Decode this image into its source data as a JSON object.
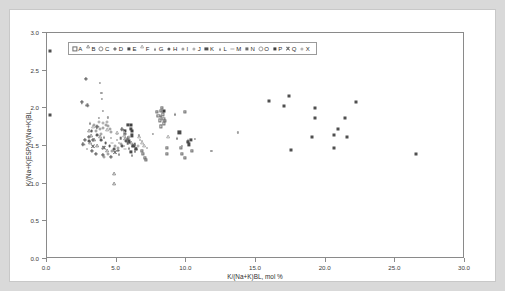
{
  "page": {
    "background_color": "#d9d9d9",
    "paper_color": "#ffffff"
  },
  "chart_data": {
    "type": "scatter",
    "title": "",
    "xlabel": "K/(Na+K)BL, mol %",
    "ylabel": "K/(Na+K)ESP/K/(Na+K)BL",
    "xlim": [
      0.0,
      30.0
    ],
    "ylim": [
      0.0,
      3.0
    ],
    "xticks": [
      "0.0",
      "5.0",
      "10.0",
      "15.0",
      "20.0",
      "25.0",
      "30.0"
    ],
    "xtick_values": [
      0,
      5,
      10,
      15,
      20,
      25,
      30
    ],
    "yticks": [
      "0.0",
      "0.5",
      "1.0",
      "1.5",
      "2.0",
      "2.5",
      "3.0"
    ],
    "ytick_values": [
      0,
      0.5,
      1.0,
      1.5,
      2.0,
      2.5,
      3.0
    ],
    "grid": false,
    "legend_position": "top-left-inside",
    "legend_border": true,
    "series": [
      {
        "name": "A",
        "marker": "open-square",
        "color": "#6d6d6d",
        "size": 3.2,
        "points": [
          [
            7.9,
            1.95
          ],
          [
            8.0,
            1.9
          ],
          [
            8.1,
            1.84
          ],
          [
            8.2,
            1.97
          ],
          [
            8.3,
            1.92
          ],
          [
            8.35,
            1.86
          ],
          [
            8.4,
            1.8
          ],
          [
            8.15,
            1.76
          ],
          [
            8.45,
            1.83
          ],
          [
            8.25,
            2.01
          ],
          [
            9.9,
            1.95
          ],
          [
            8.6,
            1.48
          ],
          [
            8.6,
            1.39
          ],
          [
            9.6,
            1.47
          ],
          [
            9.7,
            1.39
          ],
          [
            9.9,
            1.34
          ],
          [
            10.4,
            1.43
          ],
          [
            6.9,
            1.4
          ],
          [
            7.0,
            1.34
          ],
          [
            7.1,
            1.32
          ],
          [
            6.8,
            1.44
          ]
        ]
      },
      {
        "name": "B",
        "marker": "open-triangle",
        "color": "#7a7a7a",
        "size": 3.2,
        "points": [
          [
            3.0,
            1.68
          ],
          [
            3.2,
            1.62
          ],
          [
            3.4,
            1.56
          ],
          [
            3.1,
            1.52
          ],
          [
            3.6,
            1.48
          ],
          [
            4.0,
            1.46
          ],
          [
            4.3,
            1.42
          ],
          [
            3.8,
            1.6
          ],
          [
            4.8,
            1.12
          ],
          [
            4.8,
            0.98
          ],
          [
            5.6,
            1.58
          ],
          [
            6.0,
            1.52
          ],
          [
            6.2,
            1.48
          ],
          [
            6.4,
            1.44
          ]
        ]
      },
      {
        "name": "C",
        "marker": "open-circle",
        "color": "#8a8a8a",
        "size": 3.0,
        "points": [
          [
            3.4,
            1.78
          ],
          [
            3.6,
            1.76
          ],
          [
            3.8,
            1.72
          ],
          [
            4.0,
            1.74
          ],
          [
            4.2,
            1.78
          ],
          [
            4.4,
            1.76
          ],
          [
            4.5,
            1.72
          ],
          [
            3.9,
            1.66
          ],
          [
            3.5,
            1.7
          ],
          [
            4.6,
            1.68
          ],
          [
            4.9,
            1.5
          ],
          [
            5.1,
            1.48
          ],
          [
            5.3,
            1.52
          ],
          [
            4.7,
            1.44
          ],
          [
            4.4,
            1.4
          ],
          [
            4.1,
            1.36
          ]
        ]
      },
      {
        "name": "D",
        "marker": "plus",
        "color": "#6f6f6f",
        "size": 3.4,
        "points": [
          [
            2.8,
            2.39
          ],
          [
            2.5,
            2.08
          ],
          [
            2.9,
            2.04
          ],
          [
            3.6,
            1.75
          ],
          [
            3.0,
            1.62
          ],
          [
            3.3,
            1.58
          ],
          [
            3.2,
            1.44
          ],
          [
            3.5,
            1.4
          ],
          [
            4.0,
            1.38
          ],
          [
            4.6,
            1.36
          ],
          [
            5.4,
            1.72
          ],
          [
            5.6,
            1.66
          ],
          [
            5.8,
            1.6
          ],
          [
            2.7,
            1.58
          ],
          [
            2.6,
            1.52
          ]
        ]
      },
      {
        "name": "E",
        "marker": "filled-square",
        "color": "#4a4a4a",
        "size": 3.2,
        "points": [
          [
            5.8,
            1.78
          ],
          [
            6.0,
            1.73
          ],
          [
            5.6,
            1.7
          ],
          [
            6.1,
            1.64
          ],
          [
            5.9,
            1.56
          ],
          [
            6.2,
            1.5
          ],
          [
            6.4,
            1.46
          ],
          [
            6.0,
            1.42
          ],
          [
            9.5,
            1.68
          ],
          [
            10.1,
            1.55
          ],
          [
            10.2,
            1.52
          ],
          [
            10.3,
            1.58
          ]
        ]
      },
      {
        "name": "F",
        "marker": "open-triangle",
        "color": "#9a9a9a",
        "size": 3.2,
        "points": [
          [
            3.3,
            1.74
          ],
          [
            4.3,
            1.7
          ],
          [
            5.0,
            1.66
          ],
          [
            5.5,
            1.62
          ],
          [
            6.6,
            1.6
          ],
          [
            6.8,
            1.52
          ],
          [
            7.0,
            1.48
          ],
          [
            8.7,
            1.6
          ]
        ]
      },
      {
        "name": "G",
        "marker": "filled-triangle",
        "color": "#555555",
        "size": 3.2,
        "points": [
          [
            8.2,
            1.9
          ],
          [
            9.2,
            1.92
          ],
          [
            9.3,
            1.6
          ],
          [
            10.1,
            1.58
          ],
          [
            5.9,
            1.48
          ],
          [
            6.3,
            1.44
          ]
        ]
      },
      {
        "name": "H",
        "marker": "filled-circle",
        "color": "#5c5c5c",
        "size": 2.8,
        "points": [
          [
            3.2,
            1.7
          ],
          [
            3.6,
            1.64
          ],
          [
            3.9,
            1.58
          ],
          [
            4.2,
            1.54
          ],
          [
            4.5,
            1.5
          ],
          [
            4.8,
            1.46
          ],
          [
            5.1,
            1.44
          ],
          [
            5.4,
            1.5
          ],
          [
            5.7,
            1.56
          ],
          [
            3.0,
            1.56
          ]
        ]
      },
      {
        "name": "I",
        "marker": "dot",
        "color": "#9e9e9e",
        "size": 2.2,
        "points": [
          [
            3.8,
            2.34
          ],
          [
            3.9,
            2.2
          ],
          [
            3.95,
            2.12
          ],
          [
            4.0,
            1.97
          ],
          [
            3.7,
            1.87
          ],
          [
            4.4,
            1.88
          ],
          [
            6.6,
            1.64
          ],
          [
            7.6,
            1.66
          ],
          [
            9.7,
            1.5
          ],
          [
            10.6,
            1.59
          ],
          [
            11.8,
            1.43
          ],
          [
            13.7,
            1.68
          ]
        ]
      },
      {
        "name": "J",
        "marker": "dot",
        "color": "#b0b0b0",
        "size": 2.0,
        "points": [
          [
            4.6,
            1.6
          ],
          [
            5.0,
            1.58
          ],
          [
            5.2,
            1.54
          ],
          [
            5.5,
            1.5
          ],
          [
            6.7,
            1.58
          ],
          [
            7.2,
            1.48
          ],
          [
            2.9,
            1.46
          ]
        ]
      },
      {
        "name": "K",
        "marker": "filled-square",
        "color": "#4f4f4f",
        "size": 3.0,
        "points": [
          [
            0.2,
            2.76
          ],
          [
            0.2,
            1.91
          ],
          [
            15.9,
            2.1
          ],
          [
            17.0,
            2.03
          ],
          [
            17.4,
            2.17
          ],
          [
            17.5,
            1.45
          ],
          [
            19.2,
            2.0
          ],
          [
            19.2,
            1.87
          ],
          [
            19.0,
            1.62
          ],
          [
            20.6,
            1.64
          ],
          [
            20.6,
            1.48
          ],
          [
            20.9,
            1.73
          ],
          [
            21.4,
            1.87
          ],
          [
            21.5,
            1.62
          ],
          [
            22.2,
            2.08
          ],
          [
            26.5,
            1.39
          ]
        ]
      },
      {
        "name": "L",
        "marker": "filled-triangle",
        "color": "#606060",
        "size": 3.0,
        "points": [
          [
            3.1,
            1.8
          ],
          [
            4.1,
            1.62
          ],
          [
            5.2,
            1.4
          ],
          [
            6.1,
            1.38
          ]
        ]
      },
      {
        "name": "M",
        "marker": "dash",
        "color": "#a8a8a8",
        "size": 3.0,
        "points": [
          [
            4.7,
            1.54
          ],
          [
            5.0,
            1.44
          ],
          [
            5.6,
            1.46
          ]
        ]
      },
      {
        "name": "N",
        "marker": "filled-square",
        "color": "#6a6a6a",
        "size": 2.6,
        "points": [
          [
            5.3,
            1.6
          ],
          [
            5.8,
            1.54
          ],
          [
            6.3,
            1.52
          ]
        ]
      },
      {
        "name": "O",
        "marker": "open-circle",
        "color": "#9c9c9c",
        "size": 3.0,
        "points": [
          [
            4.0,
            1.8
          ],
          [
            4.3,
            1.82
          ],
          [
            3.7,
            1.82
          ],
          [
            5.9,
            1.62
          ],
          [
            6.5,
            1.5
          ]
        ]
      },
      {
        "name": "P",
        "marker": "filled-square",
        "color": "#3f3f3f",
        "size": 3.0,
        "points": [
          [
            6.0,
            1.78
          ],
          [
            6.1,
            1.7
          ],
          [
            8.4,
            1.96
          ]
        ]
      },
      {
        "name": "Q",
        "marker": "cross",
        "color": "#7d7d7d",
        "size": 3.2,
        "points": [
          [
            3.3,
            1.5
          ],
          [
            4.1,
            1.48
          ],
          [
            4.9,
            1.42
          ]
        ]
      },
      {
        "name": "X",
        "marker": "dot",
        "color": "#b5b5b5",
        "size": 2.0,
        "points": [
          [
            5.0,
            1.66
          ],
          [
            5.5,
            1.68
          ],
          [
            6.8,
            1.56
          ]
        ]
      }
    ]
  },
  "legend": {
    "entries": [
      {
        "label": "A",
        "marker": "open-square"
      },
      {
        "label": "B",
        "marker": "open-triangle"
      },
      {
        "label": "C",
        "marker": "open-circle"
      },
      {
        "label": "D",
        "marker": "plus"
      },
      {
        "label": "E",
        "marker": "filled-square"
      },
      {
        "label": "F",
        "marker": "open-triangle"
      },
      {
        "label": "G",
        "marker": "filled-triangle"
      },
      {
        "label": "H",
        "marker": "filled-circle"
      },
      {
        "label": "I",
        "marker": "dot"
      },
      {
        "label": "J",
        "marker": "dot"
      },
      {
        "label": "K",
        "marker": "filled-square"
      },
      {
        "label": "L",
        "marker": "filled-triangle"
      },
      {
        "label": "M",
        "marker": "dash"
      },
      {
        "label": "N",
        "marker": "filled-square"
      },
      {
        "label": "O",
        "marker": "open-circle"
      },
      {
        "label": "P",
        "marker": "filled-square"
      },
      {
        "label": "Q",
        "marker": "cross"
      },
      {
        "label": "X",
        "marker": "dot"
      }
    ]
  }
}
